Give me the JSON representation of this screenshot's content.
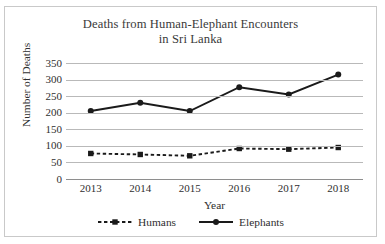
{
  "chart_data": {
    "type": "line",
    "title": "Deaths from Human-Elephant Encounters in Sri Lanka",
    "title_lines": [
      "Deaths from Human-Elephant Encounters",
      "in Sri Lanka"
    ],
    "xlabel": "Year",
    "ylabel": "Number of Deaths",
    "categories": [
      "2013",
      "2014",
      "2015",
      "2016",
      "2017",
      "2018"
    ],
    "ylim": [
      0,
      350
    ],
    "yticks": [
      350,
      300,
      250,
      200,
      150,
      100,
      50,
      0
    ],
    "ytick_labels": [
      "350",
      "300",
      "250",
      "200",
      "150",
      "100",
      "50",
      "0"
    ],
    "grid": true,
    "legend_position": "bottom",
    "series": [
      {
        "name": "Humans",
        "values": [
          77,
          74,
          70,
          92,
          90,
          95
        ],
        "color": "#1a1a1a",
        "line_style": "dashed",
        "marker": "square"
      },
      {
        "name": "Elephants",
        "values": [
          205,
          230,
          205,
          277,
          255,
          315
        ],
        "color": "#1a1a1a",
        "line_style": "solid",
        "marker": "circle"
      }
    ]
  },
  "legend": {
    "items": [
      {
        "label": "Humans"
      },
      {
        "label": "Elephants"
      }
    ]
  }
}
